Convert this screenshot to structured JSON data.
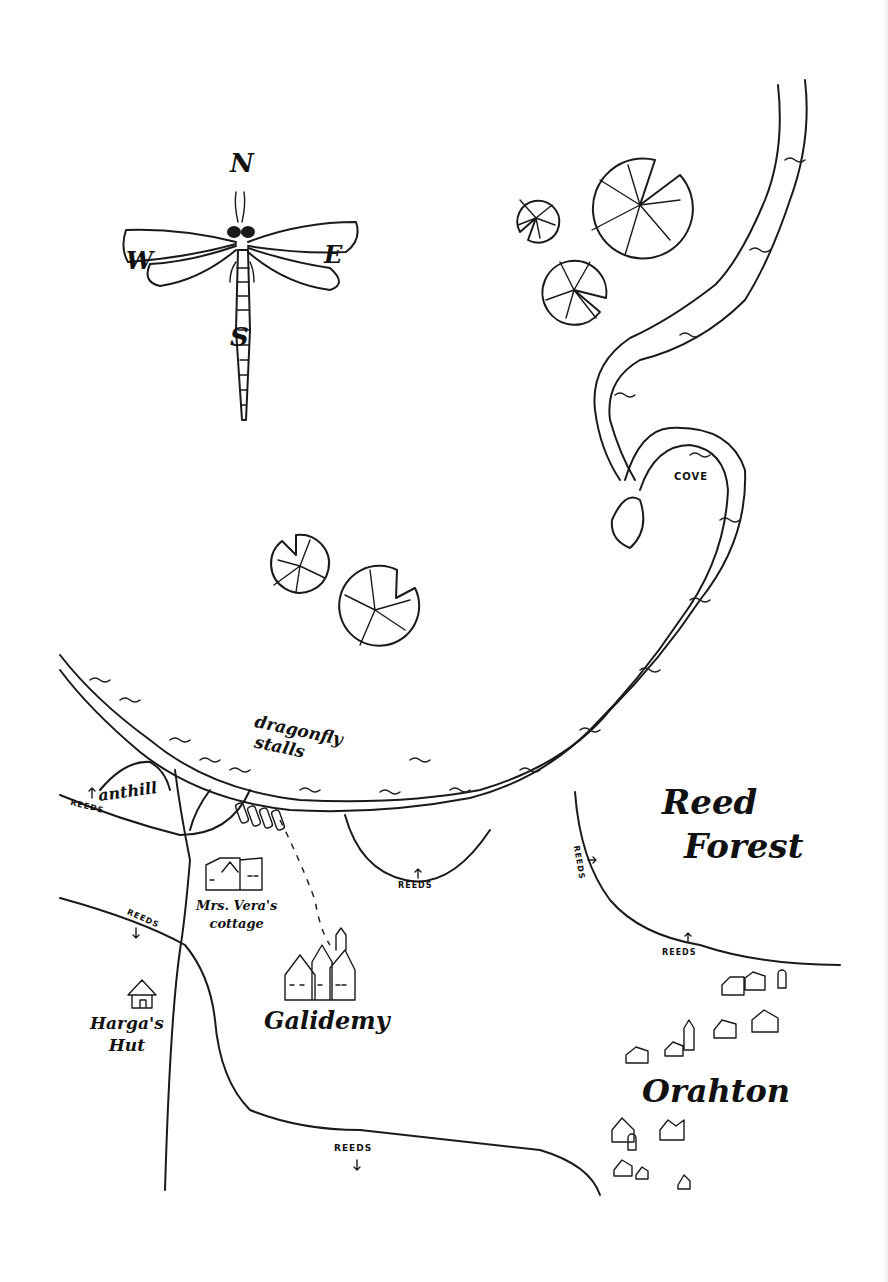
{
  "map": {
    "style": "hand-drawn ink fantasy map",
    "colors": {
      "ink": "#1a1a1a",
      "paper": "#ffffff"
    },
    "compass": {
      "icon": "dragonfly-compass",
      "north": "N",
      "south": "S",
      "east": "E",
      "west": "W"
    },
    "locations": [
      {
        "id": "cove",
        "label": "COVE",
        "type": "water-feature"
      },
      {
        "id": "dragonfly-stalls",
        "label_line1": "dragonfly",
        "label_line2": "stalls",
        "type": "market"
      },
      {
        "id": "anthill",
        "label": "anthill",
        "type": "hill"
      },
      {
        "id": "mrs-veras-cottage",
        "label_line1": "Mrs. Vera's",
        "label_line2": "cottage",
        "type": "building"
      },
      {
        "id": "galidemy",
        "label": "Galidemy",
        "type": "castle"
      },
      {
        "id": "hargas-hut",
        "label_line1": "Harga's",
        "label_line2": "Hut",
        "type": "hut"
      },
      {
        "id": "reed-forest",
        "label_line1": "Reed",
        "label_line2": "Forest",
        "type": "region"
      },
      {
        "id": "orahton",
        "label": "Orahton",
        "type": "town"
      }
    ],
    "reeds_markers": [
      {
        "label": "REEDS",
        "near": "anthill-west"
      },
      {
        "label": "REEDS",
        "near": "river-south-basin"
      },
      {
        "label": "REEDS",
        "near": "east-stream"
      },
      {
        "label": "REEDS",
        "near": "reed-forest-south"
      },
      {
        "label": "REEDS",
        "near": "hargas-hut-north"
      },
      {
        "label": "REEDS",
        "near": "southern-road"
      }
    ],
    "features": {
      "river": "winding river from north-east edge through cove to western edge",
      "lily_pads": 5,
      "path": "dashed trail from dragonfly stalls to Galidemy"
    }
  }
}
